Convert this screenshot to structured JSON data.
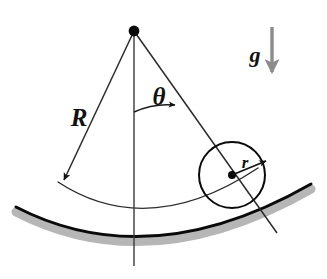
{
  "figure": {
    "background_color": "#ffffff",
    "width": 327,
    "height": 279,
    "labels": {
      "radius_big": "R",
      "angle": "θ",
      "radius_small": "r",
      "gravity": "g"
    },
    "colors": {
      "ink": "#111111",
      "line": "#333333",
      "track": "#000000",
      "track_shadow": "#a9a9a9",
      "gravity_arrow": "#8c8c8c"
    },
    "geometry": {
      "pivot": {
        "x": 134,
        "y": 31,
        "dot_radius": 5
      },
      "ball": {
        "cx": 232,
        "cy": 175,
        "r": 33,
        "center_dot_radius": 4
      },
      "radius_big_arrow_tip": {
        "x": 62,
        "y": 182
      },
      "radius_small_arrow_tip": {
        "x": 268,
        "y": 162
      },
      "vertical_line_bottom": {
        "x": 134,
        "y": 266
      },
      "right_radius_end": {
        "x": 277,
        "y": 233
      },
      "angle_arc_radius": 80,
      "angle_degrees": 33
    },
    "elements": {
      "pivot_dot": "pivot-point",
      "left_radius": "radius-R-arrow",
      "vertical_axis": "vertical-reference-line",
      "right_radius": "radius-to-ball-line",
      "angle_arc": "angle-theta-arc",
      "ball_circle": "ball-outline",
      "ball_center": "ball-center-dot",
      "small_radius": "radius-r-arrow",
      "track": "curved-track",
      "track_shadow": "curved-track-shadow",
      "center_path_arc": "ball-center-path-arc",
      "gravity_arrow": "gravity-direction-arrow"
    }
  }
}
